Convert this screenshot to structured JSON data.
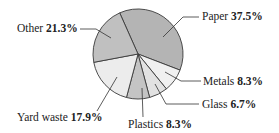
{
  "chart_data": {
    "type": "pie",
    "title": "",
    "start_angle_deg": 336,
    "direction": "clockwise",
    "slices": [
      {
        "label": "Paper",
        "value": 37.5,
        "display": "37.5%",
        "color": "#b4b4b4"
      },
      {
        "label": "Metals",
        "value": 8.3,
        "display": "8.3%",
        "color": "#f0f0f0"
      },
      {
        "label": "Glass",
        "value": 6.7,
        "display": "6.7%",
        "color": "#e2e2e2"
      },
      {
        "label": "Plastics",
        "value": 8.3,
        "display": "8.3%",
        "color": "#c4c4c4"
      },
      {
        "label": "Yard waste",
        "value": 17.9,
        "display": "17.9%",
        "color": "#ececec"
      },
      {
        "label": "Other",
        "value": 21.3,
        "display": "21.3%",
        "color": "#c0c0c0"
      }
    ]
  },
  "labels": {
    "paper": {
      "name": "Paper",
      "pct": "37.5%"
    },
    "metals": {
      "name": "Metals",
      "pct": "8.3%"
    },
    "glass": {
      "name": "Glass",
      "pct": "6.7%"
    },
    "plastics": {
      "name": "Plastics",
      "pct": "8.3%"
    },
    "yard": {
      "name": "Yard waste",
      "pct": "17.9%"
    },
    "other": {
      "name": "Other",
      "pct": "21.3%"
    }
  }
}
